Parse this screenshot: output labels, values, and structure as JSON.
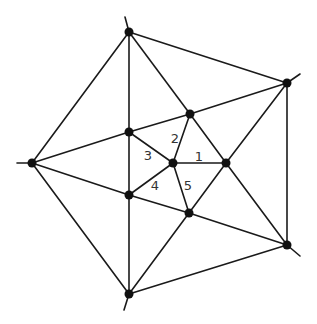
{
  "diagram": {
    "width": 317,
    "height": 324,
    "nodes": [
      {
        "id": "T",
        "x": 129,
        "y": 32
      },
      {
        "id": "TR",
        "x": 287,
        "y": 83
      },
      {
        "id": "BR",
        "x": 287,
        "y": 245
      },
      {
        "id": "B",
        "x": 129,
        "y": 294
      },
      {
        "id": "L",
        "x": 32,
        "y": 163
      },
      {
        "id": "UR",
        "x": 190,
        "y": 114
      },
      {
        "id": "UL",
        "x": 129,
        "y": 132
      },
      {
        "id": "LL",
        "x": 129,
        "y": 195
      },
      {
        "id": "LR",
        "x": 189,
        "y": 213
      },
      {
        "id": "R",
        "x": 226,
        "y": 163
      },
      {
        "id": "C",
        "x": 173,
        "y": 163
      }
    ],
    "edges": [
      [
        "T",
        "TR"
      ],
      [
        "TR",
        "BR"
      ],
      [
        "BR",
        "B"
      ],
      [
        "B",
        "L"
      ],
      [
        "L",
        "T"
      ],
      [
        "TR",
        "UR"
      ],
      [
        "UR",
        "UL"
      ],
      [
        "UL",
        "L"
      ],
      [
        "T",
        "UR"
      ],
      [
        "UR",
        "R"
      ],
      [
        "R",
        "BR"
      ],
      [
        "TR",
        "R"
      ],
      [
        "R",
        "LR"
      ],
      [
        "LR",
        "B"
      ],
      [
        "BR",
        "LR"
      ],
      [
        "LR",
        "LL"
      ],
      [
        "LL",
        "L"
      ],
      [
        "T",
        "UL"
      ],
      [
        "UL",
        "LL"
      ],
      [
        "LL",
        "B"
      ],
      [
        "C",
        "R"
      ],
      [
        "C",
        "UR"
      ],
      [
        "C",
        "UL"
      ],
      [
        "C",
        "LL"
      ],
      [
        "C",
        "LR"
      ]
    ],
    "extensions": [
      {
        "from": "T",
        "x": 125,
        "y": 17
      },
      {
        "from": "TR",
        "x": 300,
        "y": 74
      },
      {
        "from": "BR",
        "x": 300,
        "y": 256
      },
      {
        "from": "B",
        "x": 124,
        "y": 310
      },
      {
        "from": "L",
        "x": 17,
        "y": 163
      }
    ],
    "labels": [
      {
        "text": "1",
        "x": 199,
        "y": 157
      },
      {
        "text": "2",
        "x": 175,
        "y": 139
      },
      {
        "text": "3",
        "x": 148,
        "y": 156
      },
      {
        "text": "4",
        "x": 155,
        "y": 186
      },
      {
        "text": "5",
        "x": 188,
        "y": 186
      }
    ],
    "node_radius": 4.5
  }
}
